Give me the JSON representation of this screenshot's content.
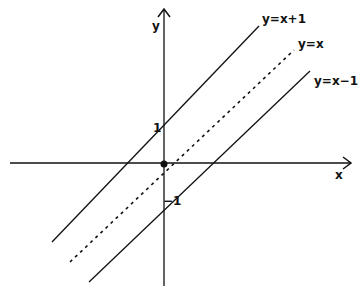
{
  "diagram": {
    "type": "coordinate-plot",
    "axes": {
      "x_label": "x",
      "y_label": "y",
      "tick_labels": {
        "y_pos": "1",
        "y_neg": "−1"
      }
    },
    "lines": [
      {
        "label": "y=x+1",
        "style": "solid"
      },
      {
        "label": "y=x",
        "style": "dashed"
      },
      {
        "label": "y=x−1",
        "style": "solid"
      }
    ],
    "origin_marker": "dot",
    "colors": {
      "ink": "#111111",
      "background": "#ffffff"
    }
  }
}
